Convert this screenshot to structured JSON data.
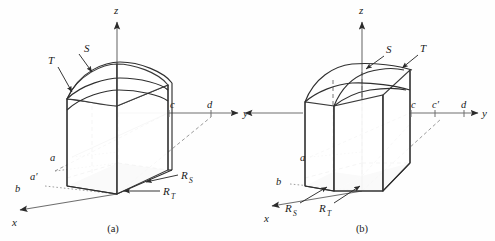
{
  "figure": {
    "background": "#fefefe",
    "stroke": "#3a3a3a",
    "shade_fill": "#b9b9b9",
    "panels": [
      {
        "id": "a",
        "caption": "(a)",
        "axes": [
          {
            "name": "z-axis",
            "label": "z"
          },
          {
            "name": "y-axis",
            "label": "y"
          },
          {
            "name": "x-axis",
            "label": "x"
          }
        ],
        "surface_labels": [
          {
            "name": "surface-S",
            "label": "S"
          },
          {
            "name": "surface-T",
            "label": "T"
          }
        ],
        "region_labels": [
          {
            "name": "region-RS",
            "label": "R",
            "sub": "S"
          },
          {
            "name": "region-RT",
            "label": "R",
            "sub": "T"
          }
        ],
        "x_axis_points": [
          {
            "name": "point-a",
            "label": "a"
          },
          {
            "name": "point-a-prime",
            "label": "a′"
          },
          {
            "name": "point-b",
            "label": "b"
          }
        ],
        "y_axis_points": [
          {
            "name": "point-c",
            "label": "c"
          },
          {
            "name": "point-d",
            "label": "d"
          }
        ]
      },
      {
        "id": "b",
        "caption": "(b)",
        "axes": [
          {
            "name": "z-axis",
            "label": "z"
          },
          {
            "name": "y-axis",
            "label": "y"
          },
          {
            "name": "x-axis",
            "label": "x"
          }
        ],
        "surface_labels": [
          {
            "name": "surface-S",
            "label": "S"
          },
          {
            "name": "surface-T",
            "label": "T"
          }
        ],
        "region_labels": [
          {
            "name": "region-RS",
            "label": "R",
            "sub": "S"
          },
          {
            "name": "region-RT",
            "label": "R",
            "sub": "T"
          }
        ],
        "x_axis_points": [
          {
            "name": "point-a",
            "label": "a"
          },
          {
            "name": "point-b",
            "label": "b"
          }
        ],
        "y_axis_points": [
          {
            "name": "point-c",
            "label": "c"
          },
          {
            "name": "point-c-prime",
            "label": "c′"
          },
          {
            "name": "point-d",
            "label": "d"
          }
        ]
      }
    ]
  }
}
